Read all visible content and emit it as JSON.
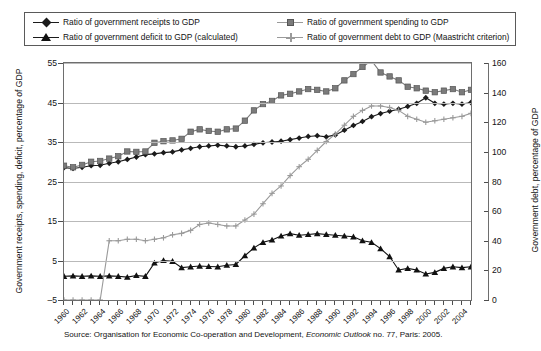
{
  "legend": {
    "items": [
      {
        "label": "Ratio of government receipts to GDP",
        "marker": "diamond-marker",
        "color": "#1b1b1b"
      },
      {
        "label": "Ratio of government spending to GDP",
        "marker": "square-marker",
        "color": "#7b7b7b"
      },
      {
        "label": "Ratio of government deficit to GDP (calculated)",
        "marker": "triangle-marker",
        "color": "#111111"
      },
      {
        "label": "Ratio of government debt to GDP (Maastricht criterion)",
        "marker": "cross-marker",
        "color": "#9a9a9a"
      }
    ]
  },
  "axes": {
    "left_title": "Government receipts, spending, deficit, percentage of GDP",
    "right_title": "Government debt, percentage of GDP",
    "left_ticks": [
      "55",
      "45",
      "35",
      "25",
      "15",
      "5",
      "-5"
    ],
    "right_ticks": [
      "160",
      "140",
      "120",
      "100",
      "80",
      "60",
      "40",
      "20",
      "0"
    ]
  },
  "source": {
    "prefix": "Source: Organisation for Economic Co-operation and Development, ",
    "italic": "Economic Outlook",
    "suffix": " no. 77, Paris: 2005."
  },
  "chart_data": {
    "type": "line",
    "title": "",
    "xlabel": "",
    "ylabel": "Government receipts, spending, deficit, percentage of GDP",
    "y2label": "Government debt, percentage of GDP",
    "ylim": [
      -5,
      55
    ],
    "y2lim": [
      0,
      160
    ],
    "grid": true,
    "legend_position": "top",
    "x": [
      1960,
      1961,
      1962,
      1963,
      1964,
      1965,
      1966,
      1967,
      1968,
      1969,
      1970,
      1971,
      1972,
      1973,
      1974,
      1975,
      1976,
      1977,
      1978,
      1979,
      1980,
      1981,
      1982,
      1983,
      1984,
      1985,
      1986,
      1987,
      1988,
      1989,
      1990,
      1991,
      1992,
      1993,
      1994,
      1995,
      1996,
      1997,
      1998,
      1999,
      2000,
      2001,
      2002,
      2003,
      2004,
      2005
    ],
    "xtick_labels": [
      "1960",
      "1962",
      "1964",
      "1966",
      "1968",
      "1970",
      "1972",
      "1974",
      "1976",
      "1978",
      "1980",
      "1982",
      "1984",
      "1986",
      "1988",
      "1990",
      "1992",
      "1994",
      "1996",
      "1998",
      "2000",
      "2002",
      "2004"
    ],
    "series": [
      {
        "name": "Ratio of government receipts to GDP",
        "axis": "left",
        "marker": "diamond",
        "color": "#1b1b1b",
        "values": [
          28.5,
          28.3,
          28.6,
          29.0,
          29.1,
          29.6,
          30.0,
          30.6,
          31.2,
          31.8,
          32.0,
          32.3,
          32.5,
          33.0,
          33.4,
          33.8,
          34.0,
          34.2,
          34.0,
          33.8,
          34.0,
          34.4,
          34.8,
          35.0,
          35.2,
          35.6,
          36.0,
          36.4,
          36.6,
          36.3,
          36.8,
          38.0,
          39.2,
          40.2,
          41.4,
          42.2,
          42.8,
          43.3,
          44.0,
          44.8,
          46.2,
          44.8,
          44.6,
          44.8,
          44.6,
          45.0
        ]
      },
      {
        "name": "Ratio of government spending to GDP",
        "axis": "left",
        "marker": "square",
        "color": "#7b7b7b",
        "values": [
          29.0,
          28.6,
          29.2,
          30.0,
          30.2,
          30.8,
          31.4,
          32.6,
          32.5,
          32.6,
          34.8,
          35.2,
          35.4,
          35.8,
          37.6,
          38.2,
          37.8,
          37.6,
          38.2,
          38.4,
          40.4,
          43.0,
          44.6,
          45.4,
          46.8,
          47.2,
          47.8,
          48.4,
          48.2,
          47.8,
          48.6,
          50.6,
          52.2,
          54.0,
          55.6,
          52.6,
          51.6,
          50.6,
          49.0,
          48.6,
          48.0,
          47.6,
          48.0,
          48.4,
          47.6,
          48.2
        ]
      },
      {
        "name": "Ratio of government deficit to GDP (calculated)",
        "axis": "left",
        "marker": "triangle",
        "color": "#111111",
        "values": [
          1.0,
          1.1,
          1.0,
          1.1,
          1.0,
          1.1,
          1.0,
          0.8,
          1.2,
          1.0,
          4.4,
          5.0,
          4.8,
          3.2,
          3.4,
          3.6,
          3.5,
          3.4,
          3.8,
          4.0,
          6.2,
          8.2,
          9.6,
          10.2,
          11.2,
          11.8,
          11.4,
          11.6,
          11.8,
          11.6,
          11.4,
          11.2,
          11.0,
          10.0,
          9.6,
          8.0,
          6.0,
          2.6,
          3.0,
          2.6,
          1.6,
          2.0,
          3.0,
          3.4,
          3.2,
          3.4
        ]
      },
      {
        "name": "Ratio of government debt to GDP (Maastricht criterion)",
        "axis": "right",
        "marker": "cross",
        "color": "#9a9a9a",
        "values": [
          0,
          0,
          0,
          0,
          0,
          40,
          40,
          41,
          41,
          40,
          41,
          42,
          44,
          45,
          47,
          51,
          52,
          51,
          50,
          50,
          54,
          58,
          65,
          72,
          77,
          84,
          90,
          95,
          101,
          107,
          112,
          118,
          124,
          128,
          131,
          131,
          130,
          128,
          124,
          122,
          120,
          121,
          122,
          123,
          124,
          126
        ]
      }
    ]
  }
}
